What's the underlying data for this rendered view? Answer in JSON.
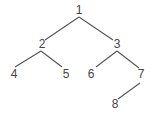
{
  "diagram": {
    "type": "binary-tree",
    "colors": {
      "edge": "#555555",
      "label": "#444444",
      "background": "#ffffff"
    },
    "nodes": [
      {
        "id": "1",
        "label": "1",
        "x": 79,
        "y": 14
      },
      {
        "id": "2",
        "label": "2",
        "x": 42,
        "y": 48
      },
      {
        "id": "3",
        "label": "3",
        "x": 117,
        "y": 48
      },
      {
        "id": "4",
        "label": "4",
        "x": 14,
        "y": 78
      },
      {
        "id": "5",
        "label": "5",
        "x": 66,
        "y": 78
      },
      {
        "id": "6",
        "label": "6",
        "x": 91,
        "y": 78
      },
      {
        "id": "7",
        "label": "7",
        "x": 141,
        "y": 78
      },
      {
        "id": "8",
        "label": "8",
        "x": 115,
        "y": 108
      }
    ],
    "edges": [
      {
        "from": "1",
        "to": "2",
        "x1": 79,
        "y1": 17,
        "x2": 45,
        "y2": 40
      },
      {
        "from": "1",
        "to": "3",
        "x1": 79,
        "y1": 17,
        "x2": 113,
        "y2": 40
      },
      {
        "from": "2",
        "to": "4",
        "x1": 41,
        "y1": 51,
        "x2": 15,
        "y2": 67
      },
      {
        "from": "2",
        "to": "5",
        "x1": 41,
        "y1": 51,
        "x2": 62,
        "y2": 67
      },
      {
        "from": "3",
        "to": "6",
        "x1": 117,
        "y1": 51,
        "x2": 96,
        "y2": 67
      },
      {
        "from": "3",
        "to": "7",
        "x1": 117,
        "y1": 51,
        "x2": 139,
        "y2": 68
      },
      {
        "from": "7",
        "to": "8",
        "x1": 140,
        "y1": 83,
        "x2": 118,
        "y2": 99
      }
    ]
  }
}
